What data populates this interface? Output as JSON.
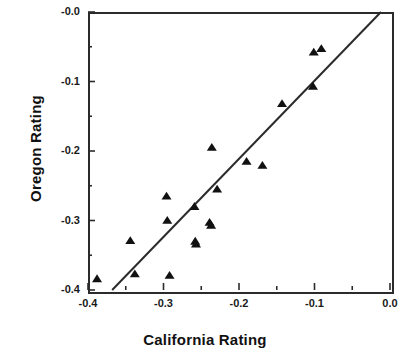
{
  "chart_data": {
    "type": "scatter",
    "title": "",
    "xlabel": "California Rating",
    "ylabel": "Oregon  Rating",
    "xlim": [
      -0.4,
      0.0
    ],
    "ylim": [
      -0.4,
      0.0
    ],
    "grid": false,
    "legend": null,
    "xticks": [
      "-0.4",
      "-0.3",
      "-0.2",
      "-0.1",
      "0.0"
    ],
    "xtick_values": [
      -0.4,
      -0.3,
      -0.2,
      -0.1,
      0.0
    ],
    "yticks": [
      "-0.0",
      "-0.1",
      "-0.2",
      "-0.3",
      "-0.4"
    ],
    "ytick_values": [
      0.0,
      -0.1,
      -0.2,
      -0.3,
      -0.4
    ],
    "minor_ticks": true,
    "marker": "triangle-up",
    "marker_color": "#111111",
    "points": [
      {
        "x": -0.388,
        "y": -0.384
      },
      {
        "x": -0.344,
        "y": -0.329
      },
      {
        "x": -0.338,
        "y": -0.377
      },
      {
        "x": -0.296,
        "y": -0.265
      },
      {
        "x": -0.295,
        "y": -0.3
      },
      {
        "x": -0.292,
        "y": -0.379
      },
      {
        "x": -0.259,
        "y": -0.28
      },
      {
        "x": -0.258,
        "y": -0.33
      },
      {
        "x": -0.257,
        "y": -0.334
      },
      {
        "x": -0.239,
        "y": -0.303
      },
      {
        "x": -0.237,
        "y": -0.307
      },
      {
        "x": -0.236,
        "y": -0.195
      },
      {
        "x": -0.229,
        "y": -0.255
      },
      {
        "x": -0.19,
        "y": -0.215
      },
      {
        "x": -0.169,
        "y": -0.221
      },
      {
        "x": -0.143,
        "y": -0.132
      },
      {
        "x": -0.102,
        "y": -0.107
      },
      {
        "x": -0.101,
        "y": -0.058
      },
      {
        "x": -0.091,
        "y": -0.053
      }
    ],
    "reference_line": {
      "label": "",
      "color": "#2b2b2b",
      "x1": -0.368,
      "y1": -0.4,
      "x2": -0.012,
      "y2": 0.0
    }
  },
  "axes": {
    "x_title": "California Rating",
    "y_title": "Oregon  Rating"
  },
  "caption": {
    "remnant": ""
  }
}
